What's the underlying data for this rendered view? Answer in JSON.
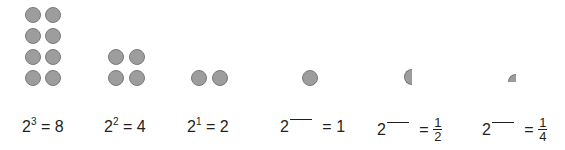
{
  "items": [
    {
      "base": "2",
      "exponent": "3",
      "equals": "=",
      "result": "8",
      "dots": 8
    },
    {
      "base": "2",
      "exponent": "2",
      "equals": "=",
      "result": "4",
      "dots": 4
    },
    {
      "base": "2",
      "exponent": "1",
      "equals": "=",
      "result": "2",
      "dots": 2
    },
    {
      "base": "2",
      "exponent": "",
      "equals": "=",
      "result": "1",
      "dots": 1
    },
    {
      "base": "2",
      "exponent": "",
      "equals": "=",
      "result_numerator": "1",
      "result_denominator": "2",
      "dots": 0.5
    },
    {
      "base": "2",
      "exponent": "",
      "equals": "=",
      "result_numerator": "1",
      "result_denominator": "4",
      "dots": 0.25
    }
  ],
  "colors": {
    "dot_fill": "#9d9d9d",
    "dot_stroke": "#7a7a7a",
    "text": "#231f20"
  }
}
